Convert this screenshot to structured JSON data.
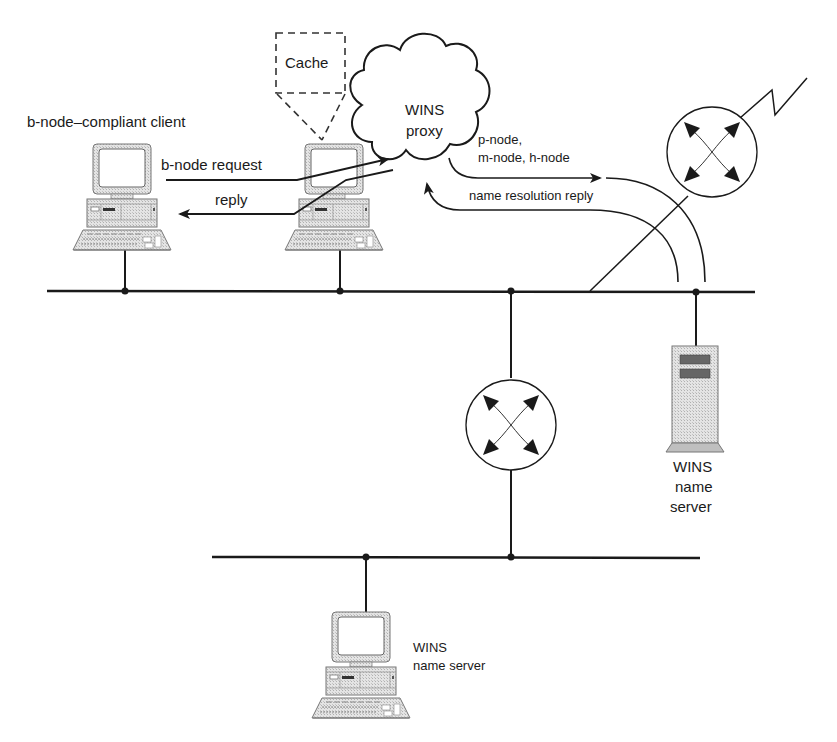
{
  "diagram": {
    "colors": {
      "line": "#1a1a1a",
      "device_fill": "#d9d9d9",
      "device_dark": "#555555",
      "background": "#ffffff"
    },
    "labels": {
      "client": "b-node–compliant client",
      "cache": "Cache",
      "proxy_line1": "WINS",
      "proxy_line2": "proxy",
      "request": "b-node request",
      "reply": "reply",
      "pmh_line1": "p-node,",
      "pmh_line2": "m-node, h-node",
      "name_reply": "name resolution reply",
      "server_right_line1": "WINS",
      "server_right_line2": "name",
      "server_right_line3": "server",
      "server_bottom_line1": "WINS",
      "server_bottom_line2": "name server"
    },
    "nodes": [
      {
        "id": "client-pc",
        "type": "desktop-computer",
        "label": "b-node–compliant client"
      },
      {
        "id": "proxy-pc",
        "type": "desktop-computer",
        "label": "WINS proxy"
      },
      {
        "id": "router-top",
        "type": "router"
      },
      {
        "id": "router-middle",
        "type": "router"
      },
      {
        "id": "server-tower",
        "type": "tower-server",
        "label": "WINS name server"
      },
      {
        "id": "server-pc",
        "type": "desktop-computer",
        "label": "WINS name server"
      }
    ],
    "segments": [
      {
        "id": "upper-lan"
      },
      {
        "id": "lower-lan"
      },
      {
        "id": "wan-link"
      }
    ]
  }
}
